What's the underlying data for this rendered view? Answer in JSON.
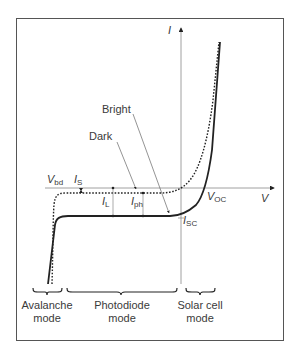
{
  "diagram": {
    "type": "photodiode I-V characteristic",
    "axes": {
      "x_label": "V",
      "y_label": "I"
    },
    "curves": [
      {
        "name": "Dark",
        "style": "dotted"
      },
      {
        "name": "Bright",
        "style": "solid"
      }
    ],
    "annotations": {
      "vbd": {
        "main": "V",
        "sub": "bd"
      },
      "is": {
        "main": "I",
        "sub": "S"
      },
      "il": {
        "main": "I",
        "sub": "L"
      },
      "iph": {
        "main": "I",
        "sub": "ph"
      },
      "voc": {
        "main": "V",
        "sub": "OC"
      },
      "isc": {
        "main": "I",
        "sub": "SC"
      },
      "bright": "Bright",
      "dark": "Dark"
    },
    "modes": [
      {
        "line1": "Avalanche",
        "line2": "mode"
      },
      {
        "line1": "Photodiode",
        "line2": "mode"
      },
      {
        "line1": "Solar cell",
        "line2": "mode"
      }
    ],
    "colors": {
      "curve": "#222222",
      "axis": "#888888",
      "frame": "#555555"
    }
  }
}
